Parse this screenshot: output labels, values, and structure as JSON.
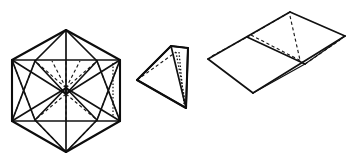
{
  "plate": {
    "background_color": "#ffffff",
    "ink_color": "#111111",
    "width": 357,
    "height": 167,
    "description": "Line drawing plate of three polyhedra",
    "figure_count": 3
  },
  "figures": [
    {
      "id": "icosahedron",
      "name": "Icosahedron",
      "position": "left",
      "projection": "three-fold axis view, hexagonal silhouette",
      "vertex_count": 12,
      "edge_count": 30,
      "face_count": 20,
      "visible_style": "solid",
      "hidden_style": "dashed",
      "outline_shape": "hexagon",
      "bbox": {
        "x": 8,
        "y": 26,
        "width": 118,
        "height": 130
      },
      "geometry": {
        "apex_top": [
          66,
          30
        ],
        "apex_bottom": [
          66,
          152
        ],
        "hex_left_top": [
          12,
          60
        ],
        "hex_right_top": [
          120,
          60
        ],
        "hex_left_bottom": [
          12,
          121
        ],
        "hex_right_bottom": [
          120,
          121
        ],
        "upper_ring": [
          [
            35,
            61
          ],
          [
            97,
            61
          ],
          [
            66,
            94
          ]
        ],
        "lower_ring": [
          [
            35,
            120
          ],
          [
            97,
            120
          ],
          [
            66,
            88
          ]
        ],
        "center": [
          66,
          91
        ]
      }
    },
    {
      "id": "tetrahedron",
      "name": "Tetrahedron",
      "position": "center",
      "projection": "oblique view",
      "vertex_count": 4,
      "edge_count": 6,
      "face_count": 4,
      "visible_style": "solid",
      "hidden_style": "dashed-and-dotted",
      "outline_shape": "triangle",
      "bbox": {
        "x": 137,
        "y": 45,
        "width": 52,
        "height": 64
      },
      "geometry": {
        "left": [
          137,
          80
        ],
        "top": [
          171,
          46
        ],
        "right_top": [
          188,
          48
        ],
        "bottom": [
          186,
          108
        ],
        "hidden_vertex": [
          176,
          52
        ]
      }
    },
    {
      "id": "folded-wedge-prism",
      "name": "Folded wedge prism",
      "position": "right",
      "projection": "oblique view",
      "vertex_count": 6,
      "edge_count": 9,
      "face_count": 5,
      "visible_style": "solid",
      "hidden_style": "dashed",
      "outline_shape": "folded quadrilateral pair",
      "bbox": {
        "x": 207,
        "y": 9,
        "width": 145,
        "height": 92
      },
      "geometry": {
        "ridge_near": [
          247,
          37
        ],
        "ridge_far": [
          290,
          12
        ],
        "front_left": [
          208,
          59
        ],
        "front_bottom": [
          253,
          93
        ],
        "right_far": [
          345,
          36
        ],
        "right_near": [
          305,
          64
        ],
        "fold_line_start": [
          247,
          37
        ],
        "fold_line_end": [
          305,
          64
        ]
      }
    }
  ],
  "labels": {
    "caption": "",
    "figure_numbers": []
  }
}
